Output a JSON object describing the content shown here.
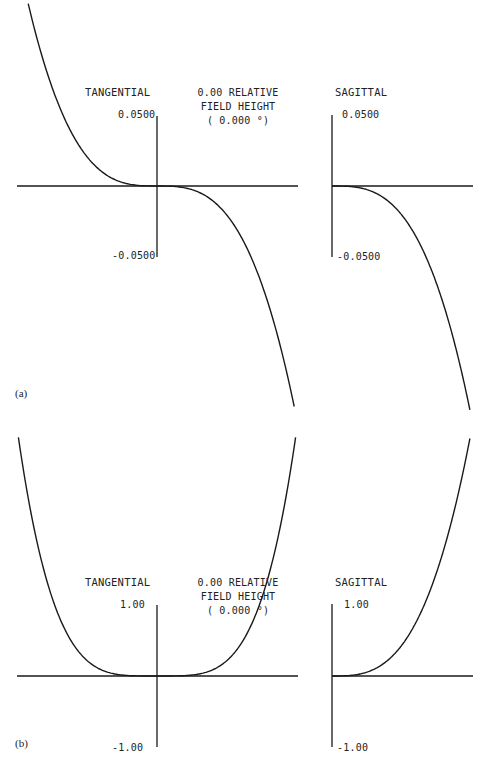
{
  "chart_data": [
    {
      "panel_label": "(a)",
      "type": "line",
      "subtitle_lines": [
        "0.00 RELATIVE",
        "FIELD HEIGHT",
        "( 0.000 °)"
      ],
      "plots": [
        {
          "title": "TANGENTIAL",
          "ytick_top": "0.0500",
          "ytick_bottom": "-0.0500",
          "ylim": [
            -0.05,
            0.05
          ],
          "xlim": [
            -1,
            1
          ],
          "description": "Ray fan: steep odd-order (cubic-like) curve from upper-left to lower-right through origin",
          "x": [
            -1.0,
            -0.75,
            -0.5,
            -0.25,
            0.0,
            0.25,
            0.5,
            0.75,
            1.0
          ],
          "y": [
            0.165,
            0.07,
            0.021,
            0.0026,
            0.0,
            -0.0026,
            -0.021,
            -0.07,
            -0.165
          ]
        },
        {
          "title": "SAGITTAL",
          "ytick_top": "0.0500",
          "ytick_bottom": "-0.0500",
          "ylim": [
            -0.05,
            0.05
          ],
          "xlim": [
            0,
            1
          ],
          "x": [
            0.0,
            0.25,
            0.5,
            0.75,
            1.0
          ],
          "y": [
            0.0,
            -0.0026,
            -0.021,
            -0.07,
            -0.165
          ]
        }
      ]
    },
    {
      "panel_label": "(b)",
      "type": "line",
      "subtitle_lines": [
        "0.00 RELATIVE",
        "FIELD HEIGHT",
        "( 0.000 °)"
      ],
      "plots": [
        {
          "title": "TANGENTIAL",
          "ytick_top": "1.00",
          "ytick_bottom": "-1.00",
          "ylim": [
            -1.0,
            1.0
          ],
          "xlim": [
            -1,
            1
          ],
          "description": "Even-order (quartic-like) U-shaped curve, flat near origin",
          "x": [
            -1.0,
            -0.75,
            -0.5,
            -0.25,
            0.0,
            0.25,
            0.5,
            0.75,
            1.0
          ],
          "y": [
            3.5,
            1.11,
            0.22,
            0.014,
            0.0,
            0.014,
            0.22,
            1.11,
            3.5
          ]
        },
        {
          "title": "SAGITTAL",
          "ytick_top": "1.00",
          "ytick_bottom": "-1.00",
          "ylim": [
            -1.0,
            1.0
          ],
          "xlim": [
            0,
            1
          ],
          "x": [
            0.0,
            0.25,
            0.5,
            0.75,
            1.0
          ],
          "y": [
            0.0,
            0.014,
            0.22,
            1.11,
            3.5
          ]
        }
      ]
    }
  ],
  "panels": {
    "a": {
      "tag": "(a)",
      "tan_title": "TANGENTIAL",
      "sag_title": "SAGITTAL",
      "field_line1": "0.00 RELATIVE",
      "field_line2": "FIELD HEIGHT",
      "field_line3": "( 0.000 °)",
      "tan_top": "0.0500",
      "tan_bottom": "-0.0500",
      "sag_top": "0.0500",
      "sag_bottom": "-0.0500"
    },
    "b": {
      "tag": "(b)",
      "tan_title": "TANGENTIAL",
      "sag_title": "SAGITTAL",
      "field_line1": "0.00 RELATIVE",
      "field_line2": "FIELD HEIGHT",
      "field_line3": "( 0.000 °)",
      "tan_top": "1.00",
      "tan_bottom": "-1.00",
      "sag_top": "1.00",
      "sag_bottom": "-1.00"
    }
  }
}
